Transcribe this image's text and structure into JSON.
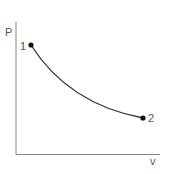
{
  "diagram": {
    "type": "pv-process",
    "y_axis_label": "P",
    "x_axis_label": "v",
    "points": [
      {
        "label": "1",
        "x": 31,
        "y": 45
      },
      {
        "label": "2",
        "x": 143,
        "y": 118
      }
    ],
    "colors": {
      "axis": "#888888",
      "curve": "#333333",
      "point": "#111111",
      "text": "#555555"
    }
  }
}
